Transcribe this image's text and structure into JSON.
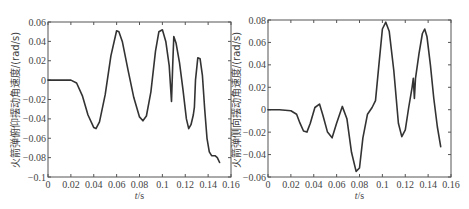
{
  "chart_data": [
    {
      "type": "line",
      "title": "",
      "xlabel": "t/s",
      "ylabel": "火箭弹俯仰摆动角速度/(rad/s)",
      "xlim": [
        0,
        0.16
      ],
      "ylim": [
        -0.1,
        0.06
      ],
      "xticks": [
        0,
        0.02,
        0.04,
        0.06,
        0.08,
        0.1,
        0.12,
        0.14,
        0.16
      ],
      "xtick_labels": [
        "0",
        "0.02",
        "0.04",
        "0.06",
        "0.08",
        "0.1",
        "0.12",
        "0.14",
        "0.16"
      ],
      "yticks": [
        0.06,
        0.04,
        0.02,
        0,
        -0.02,
        -0.04,
        -0.06,
        -0.08,
        -0.1
      ],
      "ytick_labels": [
        "0.06",
        "0.04",
        "0.02",
        "0",
        "−0.02",
        "−0.04",
        "−0.06",
        "−0.08",
        "−0.1"
      ],
      "grid": false,
      "legend": null,
      "series": [
        {
          "name": "pitch angular velocity",
          "x": [
            0,
            0.01,
            0.02,
            0.025,
            0.03,
            0.035,
            0.04,
            0.042,
            0.045,
            0.05,
            0.055,
            0.06,
            0.062,
            0.065,
            0.07,
            0.075,
            0.08,
            0.083,
            0.086,
            0.09,
            0.094,
            0.097,
            0.1,
            0.103,
            0.106,
            0.108,
            0.109,
            0.11,
            0.112,
            0.115,
            0.118,
            0.121,
            0.123,
            0.125,
            0.127,
            0.128,
            0.129,
            0.131,
            0.133,
            0.135,
            0.137,
            0.139,
            0.141,
            0.143,
            0.146,
            0.148,
            0.15
          ],
          "y": [
            0,
            0,
            0,
            -0.003,
            -0.016,
            -0.036,
            -0.049,
            -0.05,
            -0.043,
            -0.015,
            0.025,
            0.051,
            0.05,
            0.04,
            0.01,
            -0.018,
            -0.038,
            -0.042,
            -0.037,
            -0.012,
            0.03,
            0.05,
            0.052,
            0.04,
            0.015,
            -0.022,
            0.015,
            0.045,
            0.038,
            0.018,
            -0.01,
            -0.04,
            -0.05,
            -0.046,
            -0.036,
            -0.028,
            0.0,
            0.023,
            0.022,
            0.005,
            -0.03,
            -0.06,
            -0.074,
            -0.078,
            -0.078,
            -0.08,
            -0.085
          ]
        }
      ]
    },
    {
      "type": "line",
      "title": "",
      "xlabel": "t/s",
      "ylabel": "火箭弹侧向摆动角速度/(rad/s)",
      "xlim": [
        0,
        0.16
      ],
      "ylim": [
        -0.06,
        0.08
      ],
      "xticks": [
        0,
        0.02,
        0.04,
        0.06,
        0.08,
        0.1,
        0.12,
        0.14,
        0.16
      ],
      "xtick_labels": [
        "0",
        "0.02",
        "0.04",
        "0.06",
        "0.08",
        "0.1",
        "0.12",
        "0.14",
        "0.16"
      ],
      "yticks": [
        0.08,
        0.06,
        0.04,
        0.02,
        0,
        -0.02,
        -0.04,
        -0.06
      ],
      "ytick_labels": [
        "0.08",
        "0.06",
        "0.04",
        "0.02",
        "0",
        "−0.02",
        "−0.04",
        "−0.06"
      ],
      "grid": false,
      "legend": null,
      "series": [
        {
          "name": "yaw angular velocity",
          "x": [
            0,
            0.01,
            0.02,
            0.025,
            0.028,
            0.031,
            0.034,
            0.037,
            0.041,
            0.045,
            0.048,
            0.052,
            0.056,
            0.06,
            0.065,
            0.069,
            0.073,
            0.077,
            0.08,
            0.083,
            0.087,
            0.091,
            0.094,
            0.097,
            0.1,
            0.103,
            0.106,
            0.11,
            0.114,
            0.117,
            0.12,
            0.123,
            0.126,
            0.127,
            0.128,
            0.129,
            0.132,
            0.135,
            0.137,
            0.139,
            0.142,
            0.145,
            0.148,
            0.151
          ],
          "y": [
            0,
            0,
            -0.001,
            -0.004,
            -0.012,
            -0.019,
            -0.02,
            -0.012,
            0.002,
            0.005,
            -0.005,
            -0.02,
            -0.025,
            -0.012,
            0.003,
            -0.008,
            -0.038,
            -0.055,
            -0.052,
            -0.025,
            -0.004,
            0.002,
            0.008,
            0.04,
            0.072,
            0.078,
            0.07,
            0.035,
            -0.012,
            -0.024,
            -0.018,
            0.002,
            0.02,
            0.028,
            0.01,
            0.028,
            0.05,
            0.068,
            0.072,
            0.065,
            0.04,
            0.01,
            -0.015,
            -0.033
          ]
        }
      ]
    }
  ],
  "plots": [
    {
      "ylabel": "火箭弹俯仰摆动角速度/(rad/s)",
      "xlabel_italic": "t",
      "xlabel_unit": "/s"
    },
    {
      "ylabel": "火箭弹侧向摆动角速度/(rad/s)",
      "xlabel_italic": "t",
      "xlabel_unit": "/s"
    }
  ]
}
